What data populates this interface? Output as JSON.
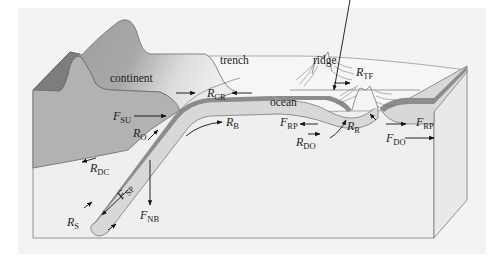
{
  "diagram": {
    "regions": {
      "continent": "continent",
      "trench": "trench",
      "ridge": "ridge",
      "ocean": "ocean"
    },
    "forces": [
      {
        "id": "F_SU",
        "symbol": "F",
        "sub": "SU"
      },
      {
        "id": "R_O",
        "symbol": "R",
        "sub": "O"
      },
      {
        "id": "R_CR",
        "symbol": "R",
        "sub": "CR"
      },
      {
        "id": "R_B",
        "symbol": "R",
        "sub": "B"
      },
      {
        "id": "F_RP_left",
        "symbol": "F",
        "sub": "RP"
      },
      {
        "id": "R_R",
        "symbol": "R",
        "sub": "R"
      },
      {
        "id": "R_TF",
        "symbol": "R",
        "sub": "TF"
      },
      {
        "id": "F_RP_right",
        "symbol": "F",
        "sub": "RP"
      },
      {
        "id": "R_DO",
        "symbol": "R",
        "sub": "DO"
      },
      {
        "id": "F_DO",
        "symbol": "F",
        "sub": "DO"
      },
      {
        "id": "R_DC",
        "symbol": "R",
        "sub": "DC"
      },
      {
        "id": "F_SP",
        "symbol": "F",
        "sub": "SP"
      },
      {
        "id": "F_NB",
        "symbol": "F",
        "sub": "NB"
      },
      {
        "id": "R_S",
        "symbol": "R",
        "sub": "S"
      }
    ],
    "colors": {
      "background": "#f1f1f1",
      "continent_dark": "#8c8c8c",
      "continent_mid": "#b4b4b4",
      "continent_light": "#cfcfcf",
      "mantle": "#efefef",
      "plate_top": "#8f8f8f",
      "plate_body": "#d9d9d9",
      "outline": "#6a6a6a"
    }
  }
}
